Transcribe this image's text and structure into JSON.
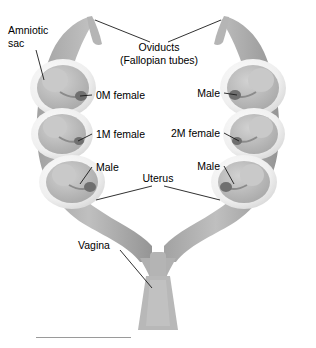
{
  "figure": {
    "background_color": "#ffffff",
    "tissue_color": "#a8a8a8",
    "sac_color": "#f2f2f2",
    "fetus_color": "#bdbdbd",
    "tubercle_color": "#6e6e6e",
    "leader_color": "#1a1a1a",
    "rule_color": "#9a9a9a"
  },
  "labels": {
    "amniotic_sac_line1": "Amniotic",
    "amniotic_sac_line2": "sac",
    "oviducts_line1": "Oviducts",
    "oviducts_line2": "(Fallopian tubes)",
    "left_0m_female": "0M female",
    "left_1m_female": "1M female",
    "left_male": "Male",
    "right_male_top": "Male",
    "right_2m_female": "2M female",
    "right_male_bottom": "Male",
    "uterus": "Uterus",
    "vagina": "Vagina"
  },
  "fetuses": [
    {
      "id": "left-top",
      "side": "left",
      "position": 1,
      "label": "0M female"
    },
    {
      "id": "left-mid",
      "side": "left",
      "position": 2,
      "label": "1M female"
    },
    {
      "id": "left-bottom",
      "side": "left",
      "position": 3,
      "label": "Male"
    },
    {
      "id": "right-top",
      "side": "right",
      "position": 1,
      "label": "Male"
    },
    {
      "id": "right-mid",
      "side": "right",
      "position": 2,
      "label": "2M female"
    },
    {
      "id": "right-bottom",
      "side": "right",
      "position": 3,
      "label": "Male"
    }
  ],
  "structures": [
    {
      "name": "oviducts",
      "label": "Oviducts (Fallopian tubes)"
    },
    {
      "name": "amniotic-sac",
      "label": "Amniotic sac"
    },
    {
      "name": "uterus",
      "label": "Uterus"
    },
    {
      "name": "vagina",
      "label": "Vagina"
    }
  ]
}
